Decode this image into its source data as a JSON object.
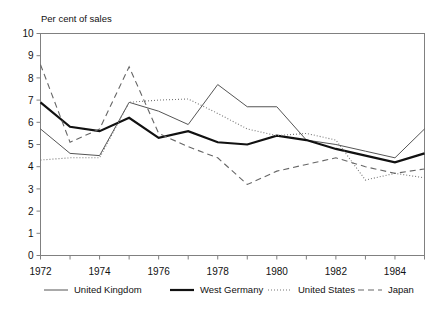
{
  "chart_data": {
    "type": "line",
    "title": "Per cent of sales",
    "ylabel": "Per cent of sales",
    "xlabel": "",
    "x": [
      1972,
      1973,
      1974,
      1975,
      1976,
      1977,
      1978,
      1979,
      1980,
      1981,
      1982,
      1983,
      1984,
      1985
    ],
    "xlim": [
      1972,
      1985
    ],
    "ylim": [
      0,
      10
    ],
    "xticks": [
      1972,
      1974,
      1976,
      1978,
      1980,
      1982,
      1984
    ],
    "xtick_labels": [
      "1972",
      "1974",
      "1976",
      "1978",
      "1980",
      "1982",
      "1984"
    ],
    "yticks": [
      0,
      1,
      2,
      3,
      4,
      5,
      6,
      7,
      8,
      9,
      10
    ],
    "ytick_labels": [
      "0",
      "1",
      "2",
      "3",
      "4",
      "5",
      "6",
      "7",
      "8",
      "9",
      "10"
    ],
    "grid": false,
    "legend_position": "bottom",
    "series": [
      {
        "name": "United Kingdom",
        "style": "solid-thin",
        "color": "#555555",
        "width": 1.0,
        "dash": "none",
        "values": [
          5.7,
          4.6,
          4.5,
          6.9,
          6.5,
          5.9,
          7.7,
          6.7,
          6.7,
          5.2,
          5.0,
          4.7,
          4.4,
          5.7
        ]
      },
      {
        "name": "West Germany",
        "style": "solid-thick",
        "color": "#111111",
        "width": 2.2,
        "dash": "none",
        "values": [
          6.9,
          5.8,
          5.6,
          6.2,
          5.3,
          5.6,
          5.1,
          5.0,
          5.4,
          5.2,
          4.8,
          4.5,
          4.2,
          4.6
        ]
      },
      {
        "name": "United States",
        "style": "dotted",
        "color": "#777777",
        "width": 1.1,
        "dash": "1,2",
        "values": [
          4.3,
          4.4,
          4.4,
          6.9,
          7.0,
          7.05,
          6.4,
          5.7,
          5.4,
          5.5,
          5.2,
          3.4,
          3.7,
          3.5
        ]
      },
      {
        "name": "Japan",
        "style": "dashed",
        "color": "#666666",
        "width": 1.1,
        "dash": "6,4",
        "values": [
          8.6,
          5.1,
          5.7,
          8.5,
          5.5,
          4.9,
          4.4,
          3.2,
          3.8,
          4.1,
          4.4,
          4.0,
          3.7,
          3.9
        ]
      }
    ]
  },
  "legend": {
    "items": [
      {
        "label": "United Kingdom"
      },
      {
        "label": "West Germany"
      },
      {
        "label": "United States"
      },
      {
        "label": "Japan"
      }
    ]
  }
}
